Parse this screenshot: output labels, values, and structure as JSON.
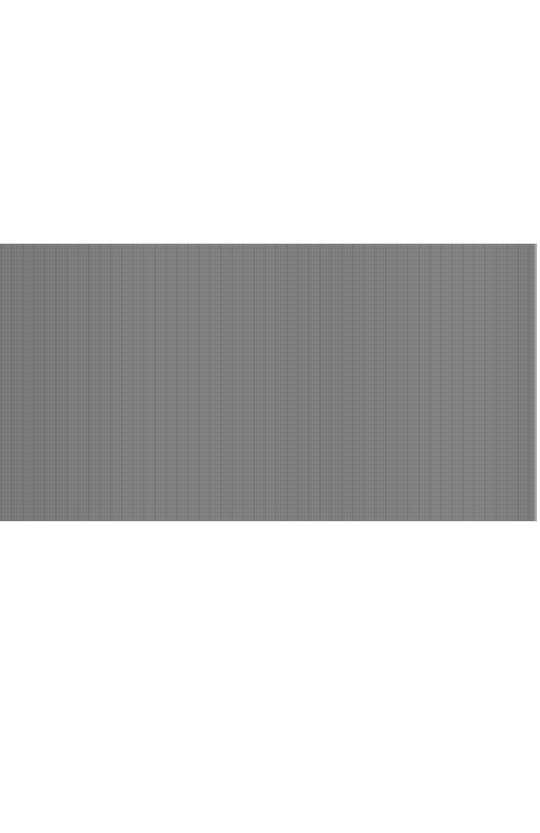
{
  "page": {
    "background": "#ffffff"
  },
  "image": {
    "description": "gray textured fabric-like photo band",
    "dominant_color": "#7e7e7e",
    "bounds": {
      "x": 0,
      "y": 244,
      "width": 537,
      "height": 277
    }
  }
}
